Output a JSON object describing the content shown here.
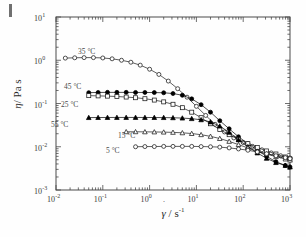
{
  "figure": {
    "corner_mark": "page-edge-tick"
  },
  "chart_data": {
    "type": "line",
    "title": "",
    "xlabel": "γ̇ / s⁻¹",
    "ylabel": "η / Pa s",
    "xlabel_symbol": "γ",
    "xlabel_unit": "/ s",
    "xlabel_exp": "-1",
    "ylabel_symbol": "η",
    "ylabel_unit": "/ Pa s",
    "xscale": "log",
    "yscale": "log",
    "xlim": [
      0.01,
      1000
    ],
    "ylim": [
      0.001,
      10
    ],
    "grid": false,
    "legend_position": "inline-annotations",
    "x_ticks": [
      "10-2",
      "10-1",
      "100",
      "101",
      "102",
      "103"
    ],
    "x_tick_labels": [
      {
        "mant": "10",
        "exp": "-2"
      },
      {
        "mant": "10",
        "exp": "-1"
      },
      {
        "mant": "10",
        "exp": "0"
      },
      {
        "mant": "10",
        "exp": "1"
      },
      {
        "mant": "10",
        "exp": "2"
      },
      {
        "mant": "10",
        "exp": "3"
      }
    ],
    "y_tick_labels": [
      {
        "mant": "10",
        "exp": "1"
      },
      {
        "mant": "10",
        "exp": "0"
      },
      {
        "mant": "10",
        "exp": "-1"
      },
      {
        "mant": "10",
        "exp": "-2"
      },
      {
        "mant": "10",
        "exp": "-3"
      }
    ],
    "series": [
      {
        "name": "35 °C",
        "label": "35 °C",
        "marker": "open-circle",
        "marker_fill": "none",
        "color": "#1a1a1a",
        "label_x": 78,
        "label_y": 47,
        "x": [
          0.0158,
          0.0251,
          0.0398,
          0.0631,
          0.1,
          0.158,
          0.251,
          0.398,
          0.631,
          1.0,
          1.58,
          2.51,
          3.98,
          6.31,
          10.0,
          15.8,
          25.1,
          39.8,
          63.1,
          100.0,
          158.0,
          251.0,
          398.0,
          631.0,
          1000.0
        ],
        "y": [
          1.12,
          1.14,
          1.15,
          1.15,
          1.13,
          1.08,
          1.0,
          0.9,
          0.77,
          0.62,
          0.47,
          0.33,
          0.22,
          0.14,
          0.086,
          0.053,
          0.033,
          0.022,
          0.016,
          0.0125,
          0.0102,
          0.0085,
          0.0072,
          0.0062,
          0.0055
        ]
      },
      {
        "name": "45 °C",
        "label": "45 °C",
        "marker": "filled-circle",
        "marker_fill": "solid",
        "color": "#000000",
        "label_x": 64,
        "label_y": 82,
        "x": [
          0.0501,
          0.0794,
          0.126,
          0.2,
          0.316,
          0.501,
          0.794,
          1.26,
          2.0,
          3.16,
          5.01,
          7.94,
          12.6,
          20.0,
          31.6,
          50.1,
          79.4,
          126.0,
          200.0,
          316.0,
          501.0,
          794.0,
          1000.0
        ],
        "y": [
          0.178,
          0.18,
          0.181,
          0.181,
          0.181,
          0.18,
          0.18,
          0.179,
          0.177,
          0.17,
          0.155,
          0.128,
          0.094,
          0.063,
          0.04,
          0.026,
          0.017,
          0.0118,
          0.0083,
          0.006,
          0.0045,
          0.0037,
          0.0034
        ]
      },
      {
        "name": "25 °C",
        "label": "25 °C",
        "marker": "open-square",
        "marker_fill": "none",
        "color": "#1a1a1a",
        "label_x": 61,
        "label_y": 100,
        "x": [
          0.0501,
          0.0794,
          0.126,
          0.2,
          0.316,
          0.501,
          0.794,
          1.26,
          2.0,
          3.16,
          5.01,
          7.94,
          12.6,
          20.0,
          31.6,
          50.1,
          79.4,
          126.0,
          200.0,
          316.0,
          501.0,
          794.0,
          1000.0
        ],
        "y": [
          0.152,
          0.15,
          0.148,
          0.145,
          0.141,
          0.136,
          0.129,
          0.12,
          0.109,
          0.096,
          0.08,
          0.063,
          0.047,
          0.034,
          0.025,
          0.019,
          0.0147,
          0.0118,
          0.0096,
          0.008,
          0.0068,
          0.0058,
          0.0052
        ]
      },
      {
        "name": "55 °C",
        "label": "55 °C",
        "marker": "filled-triangle",
        "marker_fill": "solid",
        "color": "#000000",
        "label_x": 51,
        "label_y": 120,
        "x": [
          0.0501,
          0.0794,
          0.126,
          0.2,
          0.316,
          0.501,
          0.794,
          1.26,
          2.0,
          3.16,
          5.01,
          7.94,
          12.6,
          20.0,
          31.6,
          50.1,
          79.4,
          126.0,
          200.0,
          316.0,
          501.0,
          794.0,
          1000.0
        ],
        "y": [
          0.0472,
          0.0474,
          0.0475,
          0.0476,
          0.0476,
          0.0476,
          0.0475,
          0.0474,
          0.0472,
          0.0468,
          0.046,
          0.0446,
          0.042,
          0.0375,
          0.03,
          0.0215,
          0.0145,
          0.01,
          0.0072,
          0.0054,
          0.0043,
          0.0037,
          0.0034
        ]
      },
      {
        "name": "15 °C",
        "label": "15 °C",
        "marker": "open-triangle",
        "marker_fill": "none",
        "color": "#1a1a1a",
        "label_x": 118,
        "label_y": 131,
        "x": [
          0.316,
          0.501,
          0.794,
          1.26,
          2.0,
          3.16,
          5.01,
          7.94,
          12.6,
          20.0,
          31.6,
          50.1,
          79.4,
          126.0,
          200.0,
          316.0,
          501.0,
          794.0,
          1000.0
        ],
        "y": [
          0.0222,
          0.0222,
          0.0221,
          0.022,
          0.0218,
          0.0215,
          0.021,
          0.0202,
          0.019,
          0.0174,
          0.0155,
          0.0133,
          0.0112,
          0.0094,
          0.0079,
          0.0068,
          0.0059,
          0.0052,
          0.0049
        ]
      },
      {
        "name": "5 °C",
        "label": "5 °C",
        "marker": "open-circle",
        "marker_fill": "none",
        "color": "#1a1a1a",
        "label_x": 106,
        "label_y": 146,
        "x": [
          0.501,
          0.794,
          1.26,
          2.0,
          3.16,
          5.01,
          7.94,
          12.6,
          20.0,
          31.6,
          50.1,
          79.4,
          126.0,
          200.0,
          316.0,
          501.0,
          794.0,
          1000.0
        ],
        "y": [
          0.01,
          0.0101,
          0.0101,
          0.0102,
          0.0102,
          0.0102,
          0.0102,
          0.0101,
          0.01,
          0.0098,
          0.0094,
          0.0089,
          0.0083,
          0.0076,
          0.0069,
          0.0062,
          0.0056,
          0.0053
        ]
      }
    ]
  }
}
